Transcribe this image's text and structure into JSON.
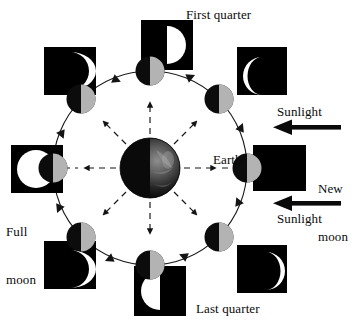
{
  "diagram": {
    "center_body": {
      "name": "Earth",
      "label": "Earth",
      "cx": 150,
      "cy": 168,
      "r": 30,
      "dark_color": "#0a0a0a",
      "lit_color": "#4a4a4a"
    },
    "orbit": {
      "cx": 150,
      "cy": 168,
      "r": 97,
      "stroke": "#1a1a1a",
      "stroke_width": 1,
      "direction": "counterclockwise",
      "arrow_count": 8
    },
    "colors": {
      "black": "#000000",
      "moon_dark": "#0c0c0c",
      "moon_lit": "#b3b3b3",
      "white": "#ffffff",
      "line": "#1a1a1a"
    },
    "rays": {
      "count": 8,
      "style": "dashed",
      "arrowhead": "filled-triangle",
      "note": "Earth-to-moon sight lines with arrowheads pointing outward"
    },
    "sunlight_arrows": [
      {
        "label": "Sunlight",
        "direction": "left",
        "x": 277,
        "y": 105
      },
      {
        "label": "Sunlight",
        "direction": "left",
        "x": 277,
        "y": 212
      }
    ],
    "positions": [
      {
        "id": "new-moon",
        "angle_deg": 0,
        "label": "New moon",
        "label_lines": [
          "New",
          "moon"
        ],
        "thumb": "all-black",
        "thumb_desc": "fully dark disc (new moon)",
        "disc": {
          "cx": 247,
          "cy": 168
        }
      },
      {
        "id": "waxing-crescent",
        "angle_deg": 45,
        "label": "",
        "label_lines": [],
        "thumb": "crescent-right",
        "thumb_desc": "thin white crescent lit on the right",
        "disc": {
          "cx": 219,
          "cy": 99
        }
      },
      {
        "id": "first-quarter",
        "angle_deg": 90,
        "label": "First quarter",
        "label_lines": [
          "First quarter"
        ],
        "thumb": "half-right",
        "thumb_desc": "right half white, left half black",
        "disc": {
          "cx": 150,
          "cy": 71
        }
      },
      {
        "id": "waxing-gibbous",
        "angle_deg": 135,
        "label": "",
        "label_lines": [],
        "thumb": "gibbous-right",
        "thumb_desc": "mostly white disc, sliver dark on left",
        "disc": {
          "cx": 81,
          "cy": 99
        }
      },
      {
        "id": "full-moon",
        "angle_deg": 180,
        "label": "Full moon",
        "label_lines": [
          "Full",
          "moon"
        ],
        "thumb": "all-white",
        "thumb_desc": "fully white disc (full moon)",
        "disc": {
          "cx": 53,
          "cy": 168
        }
      },
      {
        "id": "waning-gibbous",
        "angle_deg": 225,
        "label": "",
        "label_lines": [],
        "thumb": "gibbous-left",
        "thumb_desc": "mostly white disc, sliver dark on right",
        "disc": {
          "cx": 81,
          "cy": 237
        }
      },
      {
        "id": "last-quarter",
        "angle_deg": 270,
        "label": "Last quarter",
        "label_lines": [
          "Last quarter"
        ],
        "thumb": "half-left",
        "thumb_desc": "left half white, right half black",
        "disc": {
          "cx": 150,
          "cy": 265
        }
      },
      {
        "id": "waning-crescent",
        "angle_deg": 315,
        "label": "",
        "label_lines": [],
        "thumb": "crescent-left",
        "thumb_desc": "thin white crescent lit on the left",
        "disc": {
          "cx": 219,
          "cy": 237
        }
      }
    ],
    "labels": {
      "first_quarter": "First quarter",
      "last_quarter": "Last quarter",
      "earth": "Earth",
      "new_moon_line1": "New",
      "new_moon_line2": "moon",
      "full_moon_line1": "Full",
      "full_moon_line2": "moon",
      "sunlight_top": "Sunlight",
      "sunlight_bottom": "Sunlight"
    }
  }
}
